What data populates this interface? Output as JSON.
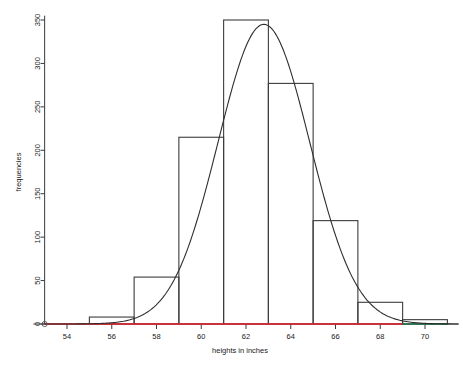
{
  "chart_data": {
    "type": "bar",
    "title": "",
    "subtitle": "",
    "xlabel": "heights in inches",
    "ylabel": "frequencies",
    "xlim": [
      52.5,
      71.5
    ],
    "ylim": [
      0,
      355
    ],
    "grid": false,
    "legend": "none",
    "xticks": [
      54,
      56,
      58,
      60,
      62,
      64,
      66,
      68,
      70
    ],
    "xtick_labels": [
      "54",
      "56",
      "58",
      "60",
      "62",
      "64",
      "66",
      "68",
      "70"
    ],
    "yticks": [
      0,
      50,
      100,
      150,
      200,
      250,
      300,
      350
    ],
    "ytick_labels": [
      "0",
      "50",
      "100",
      "150",
      "200",
      "250",
      "300",
      "350"
    ],
    "bin_width": 2,
    "bins": [
      {
        "left": 53,
        "right": 55,
        "label": "53-55",
        "value": 0
      },
      {
        "left": 55,
        "right": 57,
        "label": "55-57",
        "value": 8
      },
      {
        "left": 57,
        "right": 59,
        "label": "57-59",
        "value": 54
      },
      {
        "left": 59,
        "right": 61,
        "label": "59-61",
        "value": 215
      },
      {
        "left": 61,
        "right": 63,
        "label": "61-63",
        "value": 350
      },
      {
        "left": 63,
        "right": 65,
        "label": "63-65",
        "value": 277
      },
      {
        "left": 65,
        "right": 67,
        "label": "65-67",
        "value": 119
      },
      {
        "left": 67,
        "right": 69,
        "label": "67-69",
        "value": 25
      },
      {
        "left": 69,
        "right": 71,
        "label": "69-71",
        "value": 5
      }
    ],
    "categories": [
      "53-55",
      "55-57",
      "57-59",
      "59-61",
      "61-63",
      "63-65",
      "65-67",
      "67-69",
      "69-71"
    ],
    "values": [
      0,
      8,
      54,
      215,
      350,
      277,
      119,
      25,
      5
    ],
    "overlay_curve": {
      "name": "normal density overlay",
      "kind": "normal",
      "mean": 62.8,
      "sd": 2.05,
      "peak_value": 345,
      "color": "#2e2e2e"
    },
    "baseline_segments": [
      {
        "name": "red-baseline",
        "from": 53.0,
        "to": 69.0,
        "value": 0,
        "color": "#e8222a"
      },
      {
        "name": "green-baseline",
        "from": 69.0,
        "to": 71.0,
        "value": 0,
        "color": "#1f7a4d"
      }
    ],
    "origin_marker": {
      "name": "origin-point",
      "x": 53.0,
      "y": 0
    }
  },
  "colors": {
    "bar_stroke": "#3c3c3c",
    "curve": "#2e2e2e",
    "axis": "#3a3a3a",
    "red_line": "#e8222a",
    "green_line": "#1f7a4d",
    "background": "#ffffff",
    "text": "#1a1a1a"
  }
}
